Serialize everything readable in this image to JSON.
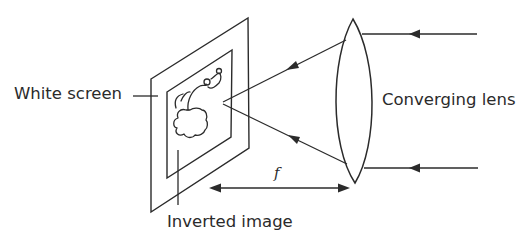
{
  "diagram": {
    "labels": {
      "white_screen": "White screen",
      "converging_lens": "Converging lens",
      "inverted_image": "Inverted image",
      "focal_length": "f"
    },
    "colors": {
      "line": "#2b2b2b",
      "background": "#ffffff"
    },
    "elements": {
      "screen": "parallelogram-screen-with-inner-frame",
      "image": "inverted-tree-like-image",
      "lens": "biconvex-lens",
      "incoming_rays": 2,
      "converging_rays": 2,
      "distance_marker": "double-arrow-f"
    }
  }
}
